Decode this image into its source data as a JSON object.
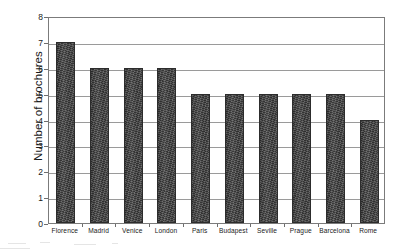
{
  "chart_data": {
    "type": "bar",
    "title": "",
    "xlabel": "",
    "ylabel": "Number of brochures",
    "categories": [
      "Florence",
      "Madrid",
      "Venice",
      "London",
      "Paris",
      "Budapest",
      "Seville",
      "Prague",
      "Barcelona",
      "Rome"
    ],
    "values": [
      7,
      6,
      6,
      6,
      5,
      5,
      5,
      5,
      5,
      4
    ],
    "ylim": [
      0,
      8
    ],
    "ytick_labels": [
      "0",
      "1",
      "2",
      "3",
      "4",
      "5",
      "6",
      "7",
      "8"
    ],
    "ytick_values": [
      0,
      1,
      2,
      3,
      4,
      5,
      6,
      7,
      8
    ],
    "grid": true,
    "legend": false,
    "bar_color": "#434343",
    "axis_color": "#7b7b7b",
    "gridline_color": "#9a9a9a",
    "background_color": "#ffffff"
  }
}
